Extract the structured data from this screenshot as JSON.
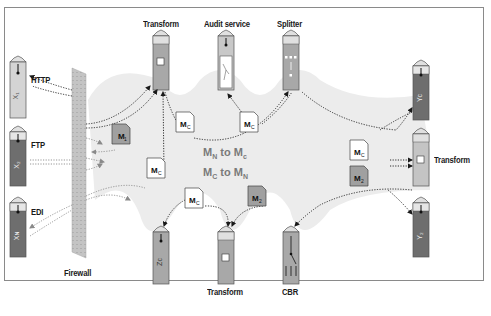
{
  "diagram": {
    "endpoints_left": [
      {
        "id": "x1",
        "protocol_label": "HTTP",
        "glyph": "X₁",
        "color": "#d0d0d0"
      },
      {
        "id": "x2",
        "protocol_label": "FTP",
        "glyph": "X₂",
        "color": "#6e6e6e"
      },
      {
        "id": "xn",
        "protocol_label": "EDI",
        "glyph": "X_N",
        "color": "#6e6e6e"
      }
    ],
    "firewall": {
      "label": "Firewall"
    },
    "services_top": [
      {
        "id": "transform-top",
        "label": "Transform",
        "icon": "transform-icon"
      },
      {
        "id": "audit",
        "label": "Audit service",
        "icon": "audit-icon"
      },
      {
        "id": "splitter",
        "label": "Splitter",
        "icon": "splitter-icon"
      }
    ],
    "services_bottom": [
      {
        "id": "zc",
        "label": "",
        "glyph": "Z_C",
        "icon": "endpoint-icon"
      },
      {
        "id": "transform-bottom",
        "label": "Transform",
        "icon": "transform-icon"
      },
      {
        "id": "cbr",
        "label": "CBR",
        "icon": "router-icon"
      }
    ],
    "endpoints_right": [
      {
        "id": "yc",
        "label": "",
        "glyph": "Y_C",
        "color": "#6e6e6e"
      },
      {
        "id": "transform-right",
        "label": "Transform",
        "icon": "transform-icon",
        "color": "#c8c8c8"
      },
      {
        "id": "y2",
        "label": "",
        "glyph": "Y₂",
        "color": "#6e6e6e"
      }
    ],
    "messages": [
      {
        "text": "M",
        "sub": "1",
        "style": "gray"
      },
      {
        "text": "M",
        "sub": "C",
        "style": "white"
      },
      {
        "text": "M",
        "sub": "C",
        "style": "white"
      },
      {
        "text": "M",
        "sub": "C",
        "style": "white"
      },
      {
        "text": "M",
        "sub": "C",
        "style": "white"
      },
      {
        "text": "M",
        "sub": "C",
        "style": "white"
      },
      {
        "text": "M",
        "sub": "2",
        "style": "gray"
      },
      {
        "text": "M",
        "sub": "2",
        "style": "gray"
      }
    ],
    "center_labels": [
      {
        "a": "M",
        "a_sub": "N",
        "mid": " to ",
        "b": "M",
        "b_sub": "c"
      },
      {
        "a": "M",
        "a_sub": "C",
        "mid": " to ",
        "b": "M",
        "b_sub": "N"
      }
    ]
  }
}
